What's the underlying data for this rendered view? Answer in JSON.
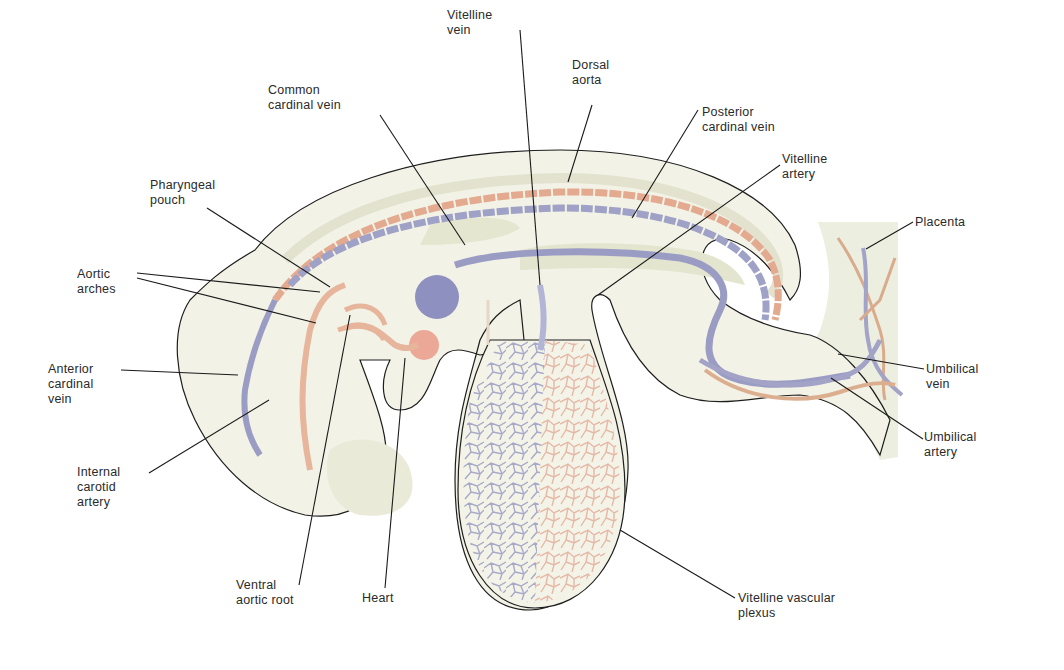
{
  "figure": {
    "colors": {
      "vein": "#9a9cc4",
      "vein_dark": "#7e80b8",
      "artery": "#e0a88e",
      "heart": "#eba897",
      "tissue": "#f1f1e4",
      "tissue_shade": "#e6e6d2",
      "outline": "#1e1e1e",
      "leader_line": "#1a1a1a",
      "placenta": "#eceedf"
    }
  },
  "labels": {
    "vitelline_vein": "Vitelline\nvein",
    "common_cardinal_vein": "Common\ncardinal vein",
    "dorsal_aorta": "Dorsal\naorta",
    "posterior_cardinal_vein": "Posterior\ncardinal vein",
    "vitelline_artery": "Vitelline\nartery",
    "pharyngeal_pouch": "Pharyngeal\npouch",
    "placenta": "Placenta",
    "aortic_arches": "Aortic\narches",
    "anterior_cardinal_vein": "Anterior\ncardinal\nvein",
    "umbilical_vein": "Umbilical\nvein",
    "umbilical_artery": "Umbilical\nartery",
    "internal_carotid_artery": "Internal\ncarotid\nartery",
    "ventral_aortic_root": "Ventral\naortic root",
    "heart": "Heart",
    "vitelline_vascular_plexus": "Vitelline vascular\nplexus"
  }
}
